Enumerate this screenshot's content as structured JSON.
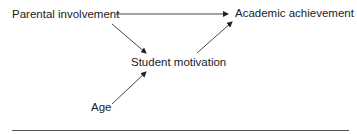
{
  "diagram": {
    "type": "path-diagram",
    "nodes": [
      {
        "id": "parental",
        "label": "Parental involvement"
      },
      {
        "id": "academic",
        "label": "Academic achievement"
      },
      {
        "id": "student",
        "label": "Student motivation"
      },
      {
        "id": "age",
        "label": "Age"
      }
    ],
    "edges": [
      {
        "from": "parental",
        "to": "academic"
      },
      {
        "from": "parental",
        "to": "student"
      },
      {
        "from": "student",
        "to": "academic"
      },
      {
        "from": "age",
        "to": "student"
      }
    ],
    "colors": {
      "text": "#1c1c1c",
      "edge": "#333333",
      "rule": "#555555",
      "background": "#ffffff"
    }
  }
}
